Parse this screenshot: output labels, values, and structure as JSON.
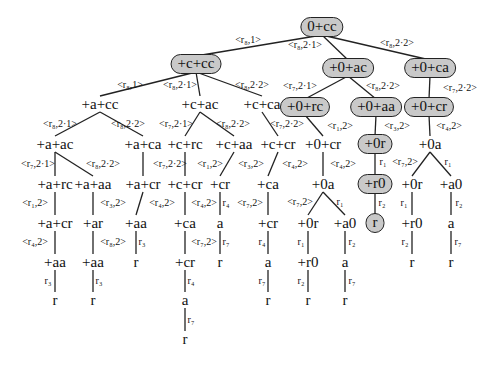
{
  "colors": {
    "shaded_fill": "#c9c9c9",
    "edge": "#222222",
    "text": "#111111"
  },
  "nodes": [
    {
      "id": "n0",
      "label": "0+cc",
      "x": 322,
      "y": 27,
      "shaded": true
    },
    {
      "id": "n1",
      "label": "+c+cc",
      "x": 196,
      "y": 64,
      "shaded": true
    },
    {
      "id": "n2",
      "label": "+0+ac",
      "x": 348,
      "y": 68,
      "shaded": true
    },
    {
      "id": "n3",
      "label": "+0+ca",
      "x": 430,
      "y": 68,
      "shaded": true
    },
    {
      "id": "n4",
      "label": "+a+cc",
      "x": 100,
      "y": 104,
      "shaded": false
    },
    {
      "id": "n5",
      "label": "+c+ac",
      "x": 200,
      "y": 104,
      "shaded": false
    },
    {
      "id": "n6",
      "label": "+c+ca",
      "x": 262,
      "y": 104,
      "shaded": false
    },
    {
      "id": "n7",
      "label": "+0+rc",
      "x": 305,
      "y": 107,
      "shaded": true
    },
    {
      "id": "n8",
      "label": "+0+aa",
      "x": 376,
      "y": 107,
      "shaded": true
    },
    {
      "id": "n9",
      "label": "+0+cr",
      "x": 429,
      "y": 107,
      "shaded": true
    },
    {
      "id": "n10",
      "label": "+a+ac",
      "x": 55,
      "y": 144,
      "shaded": false
    },
    {
      "id": "n11",
      "label": "+a+ca",
      "x": 143,
      "y": 144,
      "shaded": false
    },
    {
      "id": "n12",
      "label": "+c+rc",
      "x": 185,
      "y": 144,
      "shaded": false
    },
    {
      "id": "n13",
      "label": "+c+aa",
      "x": 234,
      "y": 144,
      "shaded": false
    },
    {
      "id": "n14",
      "label": "+c+cr",
      "x": 278,
      "y": 144,
      "shaded": false
    },
    {
      "id": "n15",
      "label": "+0+cr",
      "x": 323,
      "y": 144,
      "shaded": false
    },
    {
      "id": "n16",
      "label": "+0r",
      "x": 375,
      "y": 144,
      "shaded": true
    },
    {
      "id": "n17",
      "label": "+0a",
      "x": 430,
      "y": 144,
      "shaded": false
    },
    {
      "id": "n18",
      "label": "+a+rc",
      "x": 55,
      "y": 184,
      "shaded": false
    },
    {
      "id": "n19",
      "label": "+a+aa",
      "x": 93,
      "y": 184,
      "shaded": false
    },
    {
      "id": "n20",
      "label": "+a+cr",
      "x": 143,
      "y": 184,
      "shaded": false
    },
    {
      "id": "n21",
      "label": "+c+cr",
      "x": 185,
      "y": 184,
      "shaded": false
    },
    {
      "id": "n22",
      "label": "+cr",
      "x": 220,
      "y": 184,
      "shaded": false
    },
    {
      "id": "n23",
      "label": "+ca",
      "x": 268,
      "y": 184,
      "shaded": false
    },
    {
      "id": "n24",
      "label": "+0a",
      "x": 323,
      "y": 184,
      "shaded": false
    },
    {
      "id": "n25",
      "label": "+r0",
      "x": 375,
      "y": 184,
      "shaded": true
    },
    {
      "id": "n26",
      "label": "+0r",
      "x": 412,
      "y": 184,
      "shaded": false
    },
    {
      "id": "n27",
      "label": "+a0",
      "x": 451,
      "y": 184,
      "shaded": false
    },
    {
      "id": "n28",
      "label": "+a+cr",
      "x": 55,
      "y": 223,
      "shaded": false
    },
    {
      "id": "n29",
      "label": "+ar",
      "x": 93,
      "y": 223,
      "shaded": false
    },
    {
      "id": "n30",
      "label": "+aa",
      "x": 136,
      "y": 223,
      "shaded": false
    },
    {
      "id": "n31",
      "label": "+ca",
      "x": 185,
      "y": 223,
      "shaded": false
    },
    {
      "id": "n32",
      "label": "a",
      "x": 220,
      "y": 223,
      "shaded": false
    },
    {
      "id": "n33",
      "label": "+cr",
      "x": 268,
      "y": 223,
      "shaded": false
    },
    {
      "id": "n34",
      "label": "+0r",
      "x": 308,
      "y": 223,
      "shaded": false
    },
    {
      "id": "n35",
      "label": "+a0",
      "x": 345,
      "y": 223,
      "shaded": false
    },
    {
      "id": "n36",
      "label": "r",
      "x": 375,
      "y": 223,
      "shaded": true
    },
    {
      "id": "n37",
      "label": "+r0",
      "x": 412,
      "y": 223,
      "shaded": false
    },
    {
      "id": "n38",
      "label": "a",
      "x": 451,
      "y": 223,
      "shaded": false
    },
    {
      "id": "n39",
      "label": "+aa",
      "x": 55,
      "y": 262,
      "shaded": false
    },
    {
      "id": "n40",
      "label": "+aa",
      "x": 93,
      "y": 262,
      "shaded": false
    },
    {
      "id": "n41",
      "label": "r",
      "x": 136,
      "y": 262,
      "shaded": false
    },
    {
      "id": "n42",
      "label": "+cr",
      "x": 185,
      "y": 262,
      "shaded": false
    },
    {
      "id": "n43",
      "label": "r",
      "x": 220,
      "y": 262,
      "shaded": false
    },
    {
      "id": "n44",
      "label": "a",
      "x": 268,
      "y": 262,
      "shaded": false
    },
    {
      "id": "n45",
      "label": "+r0",
      "x": 308,
      "y": 262,
      "shaded": false
    },
    {
      "id": "n46",
      "label": "a",
      "x": 345,
      "y": 262,
      "shaded": false
    },
    {
      "id": "n47",
      "label": "r",
      "x": 412,
      "y": 262,
      "shaded": false
    },
    {
      "id": "n48",
      "label": "r",
      "x": 451,
      "y": 262,
      "shaded": false
    },
    {
      "id": "n49",
      "label": "r",
      "x": 55,
      "y": 300,
      "shaded": false
    },
    {
      "id": "n50",
      "label": "r",
      "x": 93,
      "y": 300,
      "shaded": false
    },
    {
      "id": "n51",
      "label": "a",
      "x": 185,
      "y": 300,
      "shaded": false
    },
    {
      "id": "n52",
      "label": "r",
      "x": 268,
      "y": 300,
      "shaded": false
    },
    {
      "id": "n53",
      "label": "r",
      "x": 308,
      "y": 300,
      "shaded": false
    },
    {
      "id": "n54",
      "label": "r",
      "x": 345,
      "y": 300,
      "shaded": false
    },
    {
      "id": "n55",
      "label": "r",
      "x": 185,
      "y": 339,
      "shaded": false
    }
  ],
  "edges": [
    {
      "from": "n0",
      "to": "n1",
      "label": "<r₈,1>",
      "lx": 248,
      "ly": 40
    },
    {
      "from": "n0",
      "to": "n2",
      "label": "<r₈,2·1>",
      "lx": 305,
      "ly": 45
    },
    {
      "from": "n0",
      "to": "n3",
      "label": "<r₈,2·2>",
      "lx": 397,
      "ly": 43
    },
    {
      "from": "n1",
      "to": "n4",
      "label": "<r₈,1>",
      "lx": 130,
      "ly": 85
    },
    {
      "from": "n1",
      "to": "n5",
      "label": "<r₈,2·1>",
      "lx": 180,
      "ly": 85
    },
    {
      "from": "n1",
      "to": "n6",
      "label": "<r₈,2·2>",
      "lx": 252,
      "ly": 85
    },
    {
      "from": "n2",
      "to": "n7",
      "label": "<r₇,2·1>",
      "lx": 300,
      "ly": 86
    },
    {
      "from": "n2",
      "to": "n8",
      "label": "<r₈,2·2>",
      "lx": 383,
      "ly": 86
    },
    {
      "from": "n3",
      "to": "n9",
      "label": "<r₇,2·2>",
      "lx": 460,
      "ly": 88
    },
    {
      "from": "n4",
      "to": "n10",
      "label": "<r₈,2·1>",
      "lx": 60,
      "ly": 124
    },
    {
      "from": "n4",
      "to": "n11",
      "label": "<r₈,2·2>",
      "lx": 128,
      "ly": 124
    },
    {
      "from": "n5",
      "to": "n12",
      "label": "<r₇,2·1>",
      "lx": 176,
      "ly": 124
    },
    {
      "from": "n5",
      "to": "n13",
      "label": "<r₈,2·2>",
      "lx": 233,
      "ly": 124
    },
    {
      "from": "n6",
      "to": "n14",
      "label": "<r₇,2·2>",
      "lx": 287,
      "ly": 124
    },
    {
      "from": "n7",
      "to": "n15",
      "label": "<r₁,2>",
      "lx": 340,
      "ly": 126
    },
    {
      "from": "n8",
      "to": "n16",
      "label": "<r₃,2>",
      "lx": 397,
      "ly": 126
    },
    {
      "from": "n9",
      "to": "n17",
      "label": "<r₄,2>",
      "lx": 449,
      "ly": 126
    },
    {
      "from": "n10",
      "to": "n18",
      "label": "<r₇,2·1>",
      "lx": 38,
      "ly": 164
    },
    {
      "from": "n10",
      "to": "n19",
      "label": "<r₈,2·2>",
      "lx": 103,
      "ly": 164
    },
    {
      "from": "n11",
      "to": "n20",
      "label": "<r₇,2·2>",
      "lx": 170,
      "ly": 164
    },
    {
      "from": "n12",
      "to": "n21",
      "label": "<r₁,2>",
      "lx": 210,
      "ly": 164
    },
    {
      "from": "n13",
      "to": "n22",
      "label": "<r₃,2>",
      "lx": 251,
      "ly": 164
    },
    {
      "from": "n14",
      "to": "n23",
      "label": "<r₄,2>",
      "lx": 295,
      "ly": 164
    },
    {
      "from": "n15",
      "to": "n24",
      "label": "<r₄,2>",
      "lx": 343,
      "ly": 164
    },
    {
      "from": "n16",
      "to": "n25",
      "label": "r₁",
      "lx": 383,
      "ly": 162
    },
    {
      "from": "n17",
      "to": "n26",
      "label": "<r₇,2>",
      "lx": 405,
      "ly": 162
    },
    {
      "from": "n17",
      "to": "n27",
      "label": "r₁",
      "lx": 448,
      "ly": 162
    },
    {
      "from": "n18",
      "to": "n28",
      "label": "<r₁,2>",
      "lx": 35,
      "ly": 203
    },
    {
      "from": "n19",
      "to": "n29",
      "label": "<r₃,2>",
      "lx": 113,
      "ly": 203
    },
    {
      "from": "n20",
      "to": "n30",
      "label": "<r₄,2>",
      "lx": 162,
      "ly": 203
    },
    {
      "from": "n21",
      "to": "n31",
      "label": "<r₄,2>",
      "lx": 204,
      "ly": 203
    },
    {
      "from": "n22",
      "to": "n32",
      "label": "r₄",
      "lx": 226,
      "ly": 203
    },
    {
      "from": "n23",
      "to": "n33",
      "label": "<r₇,2>",
      "lx": 250,
      "ly": 203
    },
    {
      "from": "n24",
      "to": "n34",
      "label": "<r₇,2>",
      "lx": 300,
      "ly": 202
    },
    {
      "from": "n24",
      "to": "n35",
      "label": "r₁",
      "lx": 340,
      "ly": 202
    },
    {
      "from": "n25",
      "to": "n36",
      "label": "r₂",
      "lx": 382,
      "ly": 203
    },
    {
      "from": "n26",
      "to": "n37",
      "label": "r₁",
      "lx": 404,
      "ly": 203
    },
    {
      "from": "n27",
      "to": "n38",
      "label": "r₂",
      "lx": 459,
      "ly": 203
    },
    {
      "from": "n28",
      "to": "n39",
      "label": "<r₄,2>",
      "lx": 35,
      "ly": 242
    },
    {
      "from": "n29",
      "to": "n40",
      "label": "<r₈,2>",
      "lx": 113,
      "ly": 242
    },
    {
      "from": "n30",
      "to": "n41",
      "label": "r₃",
      "lx": 142,
      "ly": 242
    },
    {
      "from": "n31",
      "to": "n42",
      "label": "<r₇,2>",
      "lx": 204,
      "ly": 242
    },
    {
      "from": "n32",
      "to": "n43",
      "label": "r₇",
      "lx": 226,
      "ly": 242
    },
    {
      "from": "n33",
      "to": "n44",
      "label": "r₄",
      "lx": 262,
      "ly": 242
    },
    {
      "from": "n34",
      "to": "n45",
      "label": "r₁",
      "lx": 301,
      "ly": 242
    },
    {
      "from": "n35",
      "to": "n46",
      "label": "r₂",
      "lx": 352,
      "ly": 242
    },
    {
      "from": "n37",
      "to": "n47",
      "label": "r₂",
      "lx": 405,
      "ly": 242
    },
    {
      "from": "n38",
      "to": "n48",
      "label": "r₇",
      "lx": 458,
      "ly": 242
    },
    {
      "from": "n39",
      "to": "n49",
      "label": "r₃",
      "lx": 48,
      "ly": 281
    },
    {
      "from": "n40",
      "to": "n50",
      "label": "r₃",
      "lx": 99,
      "ly": 281
    },
    {
      "from": "n42",
      "to": "n51",
      "label": "r₄",
      "lx": 191,
      "ly": 281
    },
    {
      "from": "n44",
      "to": "n52",
      "label": "r₇",
      "lx": 262,
      "ly": 281
    },
    {
      "from": "n45",
      "to": "n53",
      "label": "r₂",
      "lx": 301,
      "ly": 281
    },
    {
      "from": "n46",
      "to": "n54",
      "label": "r₇",
      "lx": 352,
      "ly": 281
    },
    {
      "from": "n51",
      "to": "n55",
      "label": "r₇",
      "lx": 191,
      "ly": 320
    }
  ]
}
